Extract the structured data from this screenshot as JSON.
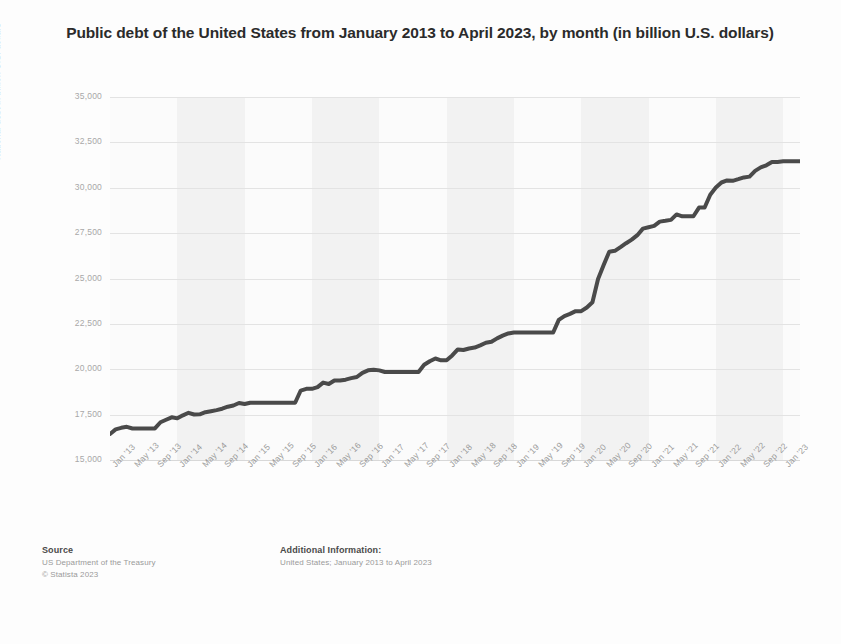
{
  "chart_data": {
    "type": "line",
    "title": "Public debt of the United States from January 2013 to April 2023, by month (in billion U.S. dollars)",
    "xlabel": "",
    "ylabel": "National debt in billion U.S. dollars",
    "ylim": [
      15000,
      35000
    ],
    "ytick_labels": [
      "35,000",
      "32,500",
      "30,000",
      "27,500",
      "25,000",
      "22,500",
      "20,000",
      "17,500",
      "15,000"
    ],
    "ytick_values": [
      35000,
      32500,
      30000,
      27500,
      25000,
      22500,
      20000,
      17500,
      15000
    ],
    "grid": true,
    "legend": false,
    "line_color": "#4a4a4a",
    "xtick_labels": [
      "Jan '13",
      "May '13",
      "Sep '13",
      "Jan '14",
      "May '14",
      "Sep '14",
      "Jan '15",
      "May '15",
      "Sep '15",
      "Jan '16",
      "May '16",
      "Sep '16",
      "Jan '17",
      "May '17",
      "Sep '17",
      "Jan '18",
      "May '18",
      "Sep '18",
      "Jan '19",
      "May '19",
      "Sep '19",
      "Jan '20",
      "May '20",
      "Sep '20",
      "Jan '21",
      "May '21",
      "Sep '21",
      "Jan '22",
      "May '22",
      "Sep '22",
      "Jan '23"
    ],
    "x": [
      "Jan '13",
      "Feb '13",
      "Mar '13",
      "Apr '13",
      "May '13",
      "Jun '13",
      "Jul '13",
      "Aug '13",
      "Sep '13",
      "Oct '13",
      "Nov '13",
      "Dec '13",
      "Jan '14",
      "Feb '14",
      "Mar '14",
      "Apr '14",
      "May '14",
      "Jun '14",
      "Jul '14",
      "Aug '14",
      "Sep '14",
      "Oct '14",
      "Nov '14",
      "Dec '14",
      "Jan '15",
      "Feb '15",
      "Mar '15",
      "Apr '15",
      "May '15",
      "Jun '15",
      "Jul '15",
      "Aug '15",
      "Sep '15",
      "Oct '15",
      "Nov '15",
      "Dec '15",
      "Jan '16",
      "Feb '16",
      "Mar '16",
      "Apr '16",
      "May '16",
      "Jun '16",
      "Jul '16",
      "Aug '16",
      "Sep '16",
      "Oct '16",
      "Nov '16",
      "Dec '16",
      "Jan '17",
      "Feb '17",
      "Mar '17",
      "Apr '17",
      "May '17",
      "Jun '17",
      "Jul '17",
      "Aug '17",
      "Sep '17",
      "Oct '17",
      "Nov '17",
      "Dec '17",
      "Jan '18",
      "Feb '18",
      "Mar '18",
      "Apr '18",
      "May '18",
      "Jun '18",
      "Jul '18",
      "Aug '18",
      "Sep '18",
      "Oct '18",
      "Nov '18",
      "Dec '18",
      "Jan '19",
      "Feb '19",
      "Mar '19",
      "Apr '19",
      "May '19",
      "Jun '19",
      "Jul '19",
      "Aug '19",
      "Sep '19",
      "Oct '19",
      "Nov '19",
      "Dec '19",
      "Jan '20",
      "Feb '20",
      "Mar '20",
      "Apr '20",
      "May '20",
      "Jun '20",
      "Jul '20",
      "Aug '20",
      "Sep '20",
      "Oct '20",
      "Nov '20",
      "Dec '20",
      "Jan '21",
      "Feb '21",
      "Mar '21",
      "Apr '21",
      "May '21",
      "Jun '21",
      "Jul '21",
      "Aug '21",
      "Sep '21",
      "Oct '21",
      "Nov '21",
      "Dec '21",
      "Jan '22",
      "Feb '22",
      "Mar '22",
      "Apr '22",
      "May '22",
      "Jun '22",
      "Jul '22",
      "Aug '22",
      "Sep '22",
      "Oct '22",
      "Nov '22",
      "Dec '22",
      "Jan '23",
      "Feb '23",
      "Mar '23",
      "Apr '23"
    ],
    "values": [
      16433,
      16687,
      16772,
      16828,
      16738,
      16738,
      16738,
      16738,
      16738,
      17078,
      17217,
      17352,
      17294,
      17463,
      17601,
      17508,
      17517,
      17632,
      17687,
      17749,
      17824,
      17937,
      18005,
      18141,
      18082,
      18155,
      18152,
      18152,
      18152,
      18152,
      18151,
      18151,
      18150,
      18153,
      18827,
      18922,
      18922,
      19013,
      19264,
      19187,
      19381,
      19382,
      19427,
      19510,
      19573,
      19805,
      19939,
      19977,
      19937,
      19847,
      19847,
      19847,
      19845,
      19845,
      19845,
      19845,
      20245,
      20443,
      20591,
      20493,
      20493,
      20759,
      21090,
      21063,
      21145,
      21195,
      21317,
      21459,
      21516,
      21703,
      21851,
      21974,
      22027,
      22028,
      22028,
      22028,
      22027,
      22024,
      22023,
      22027,
      22720,
      22932,
      23050,
      23201,
      23201,
      23400,
      23687,
      24974,
      25746,
      26477,
      26525,
      26728,
      26945,
      27142,
      27386,
      27748,
      27826,
      27900,
      28133,
      28177,
      28231,
      28530,
      28427,
      28427,
      28428,
      28909,
      28910,
      29617,
      30012,
      30289,
      30402,
      30383,
      30471,
      30570,
      30614,
      30929,
      31120,
      31235,
      31419,
      31420,
      31455,
      31458,
      31458,
      31458
    ]
  },
  "footer": {
    "source_heading": "Source",
    "source_lines": [
      "US Department of the Treasury",
      "© Statista 2023"
    ],
    "additional_heading": "Additional Information:",
    "additional_lines": [
      "United States; January 2013 to April 2023"
    ]
  }
}
